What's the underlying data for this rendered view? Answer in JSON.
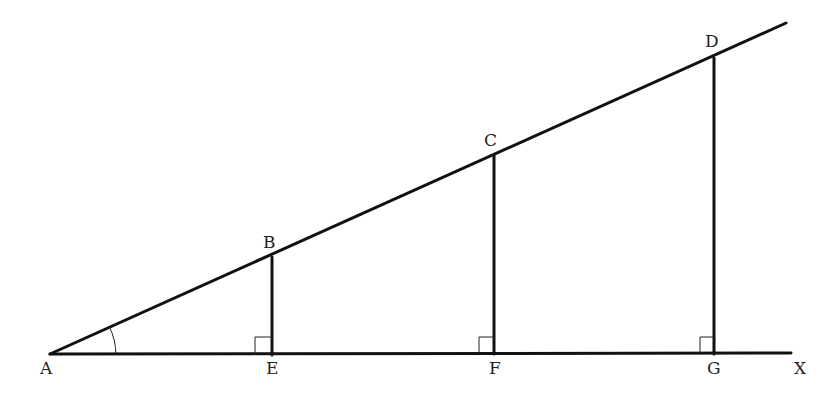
{
  "diagram": {
    "points": {
      "A": {
        "label": "A",
        "x": 50,
        "y": 354
      },
      "B": {
        "label": "B",
        "x": 272,
        "y": 257
      },
      "C": {
        "label": "C",
        "x": 494,
        "y": 155
      },
      "D": {
        "label": "D",
        "x": 713,
        "y": 58
      },
      "E": {
        "label": "E",
        "x": 272,
        "y": 355
      },
      "F": {
        "label": "F",
        "x": 494,
        "y": 354
      },
      "G": {
        "label": "G",
        "x": 714,
        "y": 354
      },
      "X": {
        "label": "X"
      }
    },
    "labels": {
      "A": "A",
      "B": "B",
      "C": "C",
      "D": "D",
      "E": "E",
      "F": "F",
      "G": "G",
      "X": "X"
    },
    "segments": [
      "AX",
      "AD (extended)",
      "BE",
      "CF",
      "DG"
    ],
    "right_angles": [
      "E",
      "F",
      "G"
    ],
    "angle_marks": [
      "A"
    ],
    "stroke_color": "#111111",
    "background": "#ffffff"
  }
}
